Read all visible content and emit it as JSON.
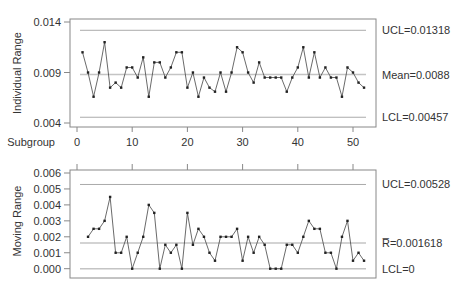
{
  "chart_data": [
    {
      "type": "line",
      "title": "",
      "xlabel": "Subgroup",
      "ylabel": "Individual Range",
      "ylim": [
        0.004,
        0.014
      ],
      "yticks": [
        "0.004",
        "0.009",
        "0.014"
      ],
      "xticks": [
        "0",
        "10",
        "20",
        "30",
        "40",
        "50"
      ],
      "grid": false,
      "x": [
        1,
        2,
        3,
        4,
        5,
        6,
        7,
        8,
        9,
        10,
        11,
        12,
        13,
        14,
        15,
        16,
        17,
        18,
        19,
        20,
        21,
        22,
        23,
        24,
        25,
        26,
        27,
        28,
        29,
        30,
        31,
        32,
        33,
        34,
        35,
        36,
        37,
        38,
        39,
        40,
        41,
        42,
        43,
        44,
        45,
        46,
        47,
        48,
        49,
        50,
        51,
        52
      ],
      "values": [
        0.011,
        0.009,
        0.0066,
        0.009,
        0.012,
        0.0075,
        0.008,
        0.0075,
        0.0095,
        0.0095,
        0.0085,
        0.0105,
        0.0066,
        0.01,
        0.01,
        0.0085,
        0.0095,
        0.011,
        0.011,
        0.0075,
        0.009,
        0.0066,
        0.0085,
        0.0075,
        0.0071,
        0.009,
        0.0071,
        0.009,
        0.0115,
        0.011,
        0.009,
        0.008,
        0.01,
        0.0085,
        0.0085,
        0.0085,
        0.0085,
        0.0071,
        0.0085,
        0.0095,
        0.0115,
        0.0085,
        0.011,
        0.0085,
        0.0095,
        0.0085,
        0.0085,
        0.0066,
        0.0095,
        0.009,
        0.008,
        0.0075
      ],
      "control_lines": {
        "ucl": 0.01318,
        "center": 0.0088,
        "lcl": 0.00457
      },
      "annotations": {
        "ucl_label": "UCL=0.01318",
        "center_label": "Mean=0.0088",
        "lcl_label": "LCL=0.00457"
      }
    },
    {
      "type": "line",
      "title": "",
      "xlabel": "",
      "ylabel": "Moving Range",
      "ylim": [
        0.0,
        0.006
      ],
      "yticks": [
        "0.000",
        "0.001",
        "0.002",
        "0.003",
        "0.004",
        "0.005",
        "0.006"
      ],
      "grid": false,
      "x": [
        2,
        3,
        4,
        5,
        6,
        7,
        8,
        9,
        10,
        11,
        12,
        13,
        14,
        15,
        16,
        17,
        18,
        19,
        20,
        21,
        22,
        23,
        24,
        25,
        26,
        27,
        28,
        29,
        30,
        31,
        32,
        33,
        34,
        35,
        36,
        37,
        38,
        39,
        40,
        41,
        42,
        43,
        44,
        45,
        46,
        47,
        48,
        49,
        50,
        51,
        52
      ],
      "values": [
        0.002,
        0.0025,
        0.0025,
        0.003,
        0.0045,
        0.001,
        0.001,
        0.002,
        0.0,
        0.001,
        0.002,
        0.004,
        0.0035,
        0.0,
        0.0015,
        0.001,
        0.0015,
        0.0,
        0.0035,
        0.0015,
        0.0025,
        0.002,
        0.001,
        0.0005,
        0.002,
        0.002,
        0.002,
        0.0025,
        0.0005,
        0.002,
        0.001,
        0.002,
        0.0015,
        0.0,
        0.0,
        0.0,
        0.0015,
        0.0015,
        0.001,
        0.002,
        0.003,
        0.0025,
        0.0025,
        0.001,
        0.001,
        0.0,
        0.002,
        0.003,
        0.0005,
        0.001,
        0.0005
      ],
      "control_lines": {
        "ucl": 0.00528,
        "center": 0.001618,
        "lcl": 0
      },
      "annotations": {
        "ucl_label": "UCL=0.00528",
        "center_label": "R̅=0.001618",
        "lcl_label": "LCL=0"
      }
    }
  ],
  "colors": {
    "frame": "#888888",
    "control_line": "#aaaaaa",
    "center_line": "#bbbbbb",
    "series": "#333333",
    "text": "#333333"
  }
}
